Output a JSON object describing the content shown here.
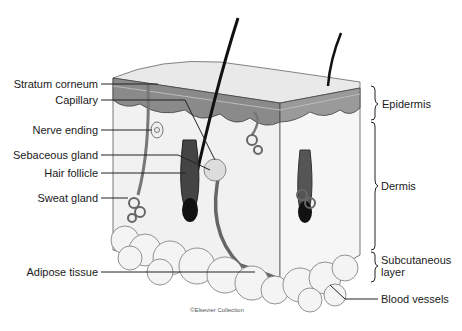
{
  "diagram": {
    "left_labels": [
      {
        "text": "Stratum corneum",
        "y": 83
      },
      {
        "text": "Capillary",
        "y": 100
      },
      {
        "text": "Nerve ending",
        "y": 129
      },
      {
        "text": "Sebaceous gland",
        "y": 154
      },
      {
        "text": "Hair follicle",
        "y": 173
      },
      {
        "text": "Sweat gland",
        "y": 197
      },
      {
        "text": "Adipose tissue",
        "y": 272
      }
    ],
    "right_labels": [
      {
        "text": "Epidermis",
        "y": 103
      },
      {
        "text": "Dermis",
        "y": 186
      },
      {
        "text": "Subcutaneous",
        "y": 260
      },
      {
        "text": "layer",
        "y": 272
      },
      {
        "text": "Blood vessels",
        "y": 298
      }
    ],
    "credit": "©Elsevier Collection"
  }
}
